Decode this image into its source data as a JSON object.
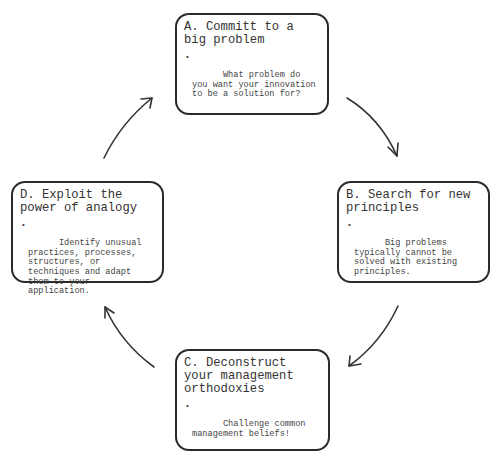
{
  "diagram": {
    "type": "cycle",
    "stroke_color": "#2a2a2a",
    "text_color": "#333333",
    "steps": [
      {
        "id": "A",
        "title": "A. Committ to a big problem",
        "bullets": [
          "What problem do you want your innovation to be a solution for?"
        ]
      },
      {
        "id": "B",
        "title": "B. Search for new principles",
        "bullets": [
          "Big problems typically cannot be solved with existing principles."
        ]
      },
      {
        "id": "C",
        "title": "C. Deconstruct your management orthodoxies",
        "bullets": [
          "Challenge common management beliefs!"
        ]
      },
      {
        "id": "D",
        "title": "D. Exploit the power of analogy",
        "bullets": [
          "Identify unusual practices, processes, structures, or techniques and adapt them to your application."
        ]
      }
    ],
    "arrows": [
      {
        "from": "A",
        "to": "B"
      },
      {
        "from": "B",
        "to": "C"
      },
      {
        "from": "C",
        "to": "D"
      },
      {
        "from": "D",
        "to": "A"
      }
    ],
    "bullet_glyph": "•"
  }
}
